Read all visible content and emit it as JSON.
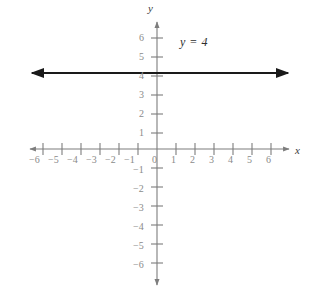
{
  "chart_data": {
    "type": "line",
    "title": "",
    "xlabel": "x",
    "ylabel": "y",
    "equation_label": "y = 4",
    "grid": false,
    "legend": "none",
    "xlim": [
      -7,
      7
    ],
    "ylim": [
      -7,
      7
    ],
    "x_ticks": [
      -6,
      -5,
      -4,
      -3,
      -2,
      -1,
      1,
      2,
      3,
      4,
      5,
      6
    ],
    "y_ticks": [
      6,
      5,
      4,
      3,
      2,
      1,
      -1,
      -2,
      -3,
      -4,
      -5,
      -6
    ],
    "x_tick_labels": [
      "−6",
      "−5",
      "−4",
      "−3",
      "−2",
      "−1",
      "1",
      "2",
      "3",
      "4",
      "5",
      "6"
    ],
    "y_tick_labels": [
      "6",
      "5",
      "4",
      "3",
      "2",
      "1",
      "−1",
      "−2",
      "−3",
      "−4",
      "−5",
      "−6"
    ],
    "origin_label": "0",
    "series": [
      {
        "name": "y = 4",
        "type": "horizontal-line",
        "y_value": 4,
        "x_range": [
          -6.3,
          6.4
        ],
        "arrows": "both",
        "color": "#1a1a1a"
      }
    ]
  },
  "axes": {
    "x_name": "x",
    "y_name": "y",
    "origin": "0",
    "axis_color": "#7d7d7d",
    "tick_color": "#7d7d7d",
    "label_color": "#8a8a8a"
  },
  "annotations": {
    "equation": "y = 4",
    "equation_color": "#2e2e2e"
  },
  "x_axis_labels": [
    {
      "text": "−6",
      "left": 29,
      "top": 155
    },
    {
      "text": "−5",
      "left": 48,
      "top": 155
    },
    {
      "text": "−4",
      "left": 67,
      "top": 155
    },
    {
      "text": "−3",
      "left": 86,
      "top": 155
    },
    {
      "text": "−2",
      "left": 105,
      "top": 155
    },
    {
      "text": "−1",
      "left": 124,
      "top": 155
    },
    {
      "text": "1",
      "left": 171,
      "top": 155
    },
    {
      "text": "2",
      "left": 190,
      "top": 155
    },
    {
      "text": "3",
      "left": 209,
      "top": 155
    },
    {
      "text": "4",
      "left": 228,
      "top": 155
    },
    {
      "text": "5",
      "left": 247,
      "top": 155
    },
    {
      "text": "6",
      "left": 266,
      "top": 155
    }
  ],
  "y_axis_labels": [
    {
      "text": "6",
      "left": 139,
      "top": 33
    },
    {
      "text": "5",
      "left": 139,
      "top": 52
    },
    {
      "text": "4",
      "left": 139,
      "top": 71
    },
    {
      "text": "3",
      "left": 139,
      "top": 90
    },
    {
      "text": "2",
      "left": 139,
      "top": 109
    },
    {
      "text": "1",
      "left": 139,
      "top": 128
    },
    {
      "text": "−1",
      "left": 133,
      "top": 165
    },
    {
      "text": "−2",
      "left": 133,
      "top": 184
    },
    {
      "text": "−3",
      "left": 133,
      "top": 203
    },
    {
      "text": "−4",
      "left": 133,
      "top": 222
    },
    {
      "text": "−5",
      "left": 133,
      "top": 241
    },
    {
      "text": "−6",
      "left": 133,
      "top": 260
    }
  ],
  "origin_label_pos": {
    "text": "0",
    "left": 152,
    "top": 155
  }
}
